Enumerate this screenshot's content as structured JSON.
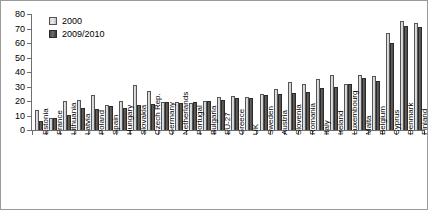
{
  "chart_data": {
    "type": "bar",
    "title": "",
    "subtitle": "",
    "xlabel": "",
    "ylabel": "",
    "ylim": [
      0,
      80
    ],
    "yticks": [
      0,
      10,
      20,
      30,
      40,
      50,
      60,
      70,
      80
    ],
    "grid": false,
    "legend_position": "top-left",
    "orientation": "vertical",
    "categories": [
      "Estonia",
      "France",
      "Lithuania",
      "Latvia",
      "Poland",
      "Spain",
      "Hungary",
      "Slovakia",
      "Czech Rep.",
      "Germany",
      "Netherlands",
      "Portugal",
      "Bulgaria",
      "EU-27",
      "Greece",
      "UK",
      "Sweden",
      "Austria",
      "Slovenia",
      "Romania",
      "Italy",
      "Ireland",
      "Luxembourg",
      "Malta",
      "Belgium",
      "Cyprus",
      "Denmark",
      "Finland"
    ],
    "series": [
      {
        "name": "2000",
        "color": "#e0e0e0",
        "values": [
          14,
          8.5,
          20,
          20.5,
          24,
          17,
          20,
          31,
          27,
          19.5,
          19,
          18.5,
          20,
          23,
          23.5,
          23,
          25,
          28,
          33,
          32,
          35,
          38,
          32,
          38,
          37,
          67,
          75,
          74
        ]
      },
      {
        "name": "2009/2010",
        "color": "#555555",
        "values": [
          6.5,
          8,
          10.5,
          15,
          14.5,
          16.5,
          15,
          17.5,
          18,
          19,
          18.5,
          19.5,
          20,
          20.5,
          22,
          22,
          24,
          25,
          25.5,
          26,
          29,
          30,
          32,
          36,
          34,
          60,
          72,
          71
        ]
      }
    ]
  },
  "legend": {
    "items": [
      {
        "label": "2000"
      },
      {
        "label": "2009/2010"
      }
    ]
  },
  "colors": {
    "series_2000": "#e0e0e0",
    "series_2009": "#555555",
    "axis": "#6f6f6f",
    "border": "#9a9a9a",
    "text": "#000000"
  }
}
